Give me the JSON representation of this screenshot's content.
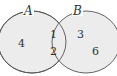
{
  "diagram": {
    "type": "venn",
    "fill_color": "#ececec",
    "stroke_color": "#555555",
    "sets": [
      {
        "name": "A",
        "only_elements": [
          "4"
        ]
      },
      {
        "name": "B",
        "only_elements": [
          "3",
          "6"
        ]
      }
    ],
    "intersection": [
      "1",
      "2"
    ],
    "labels": {
      "set_a": "A",
      "set_b": "B",
      "a_only_1": "4",
      "inter_1": "1",
      "inter_2": "2",
      "b_only_1": "3",
      "b_only_2": "6"
    }
  }
}
